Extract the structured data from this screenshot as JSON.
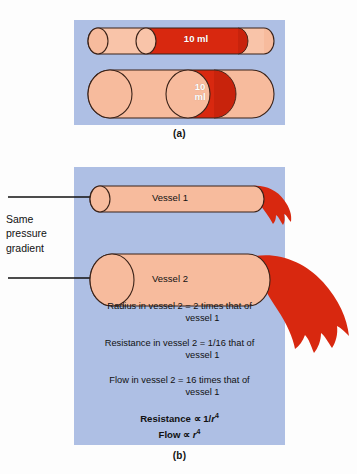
{
  "figure": {
    "panel_a": {
      "caption": "(a)",
      "vessel_small": {
        "volume_label": "10 ml"
      },
      "vessel_large": {
        "volume_label": "10\nml"
      }
    },
    "panel_b": {
      "caption": "(b)",
      "vessel_1_label": "Vessel 1",
      "vessel_2_label": "Vessel 2",
      "side_label": "Same pressure gradient",
      "stats": [
        {
          "part1": "Radius in vessel 2 = 2 times that of",
          "part2": "vessel 1"
        },
        {
          "part1": "Resistance in vessel 2 = 1/16 that of",
          "part2": "vessel 1"
        },
        {
          "part1": "Flow in vessel 2 = 16 times that of",
          "part2": "vessel 1"
        }
      ],
      "formulas": [
        {
          "name": "Resistance",
          "prop": "∝",
          "expr_pre": "1/",
          "var": "r",
          "exp": "4"
        },
        {
          "name": "Flow",
          "prop": "∝",
          "expr_pre": "",
          "var": "r",
          "exp": "4"
        }
      ]
    }
  },
  "colors": {
    "panel_bg": "#aebfe4",
    "vessel_fill": "#f6b394",
    "vessel_fill_light": "#f9c4a9",
    "vessel_end_fill": "#f8bd9f",
    "blood_red": "#d8280f",
    "blood_red_dark": "#c01f08",
    "outline": "#3a2218",
    "page_bg": "#ffffff",
    "text": "#111111"
  }
}
